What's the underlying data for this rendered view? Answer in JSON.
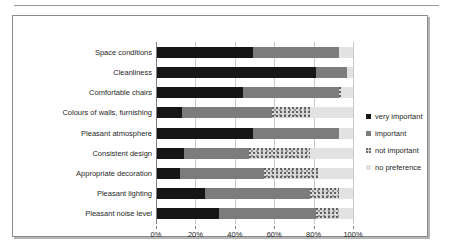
{
  "chart_data": {
    "type": "bar",
    "orientation": "horizontal",
    "stacked": true,
    "stack_mode": "percent",
    "title": "",
    "subtitle": "",
    "xlabel": "",
    "ylabel": "",
    "xlim": [
      0,
      100
    ],
    "grid": true,
    "legend_position": "right",
    "xticks": [
      "0%",
      "20%",
      "40%",
      "60%",
      "80%",
      "100%"
    ],
    "xtick_values": [
      0,
      20,
      40,
      60,
      80,
      100
    ],
    "categories": [
      "Space conditions",
      "Cleanliness",
      "Comfortable chairs",
      "Colours of walls, furnishing",
      "Pleasant atmosphere",
      "Consistent design",
      "Appropriate decoration",
      "Pleasant lighting",
      "Pleasant noise level"
    ],
    "series": [
      {
        "name": "very important",
        "color": "#161616",
        "values": [
          49,
          81,
          44,
          13,
          49,
          14,
          12,
          25,
          32
        ]
      },
      {
        "name": "important",
        "color": "#7c7c7c",
        "values": [
          44,
          16,
          49,
          46,
          44,
          33,
          43,
          53,
          49
        ]
      },
      {
        "name": "not important",
        "color": "#d8d8d8",
        "values": [
          0,
          0,
          1,
          19,
          0,
          31,
          27,
          15,
          12
        ]
      },
      {
        "name": "no preference",
        "color": "#e2e2e2",
        "values": [
          7,
          3,
          6,
          22,
          7,
          22,
          18,
          7,
          7
        ]
      }
    ]
  },
  "legend": {
    "items": [
      "very important",
      "important",
      "not important",
      "no preference"
    ]
  }
}
